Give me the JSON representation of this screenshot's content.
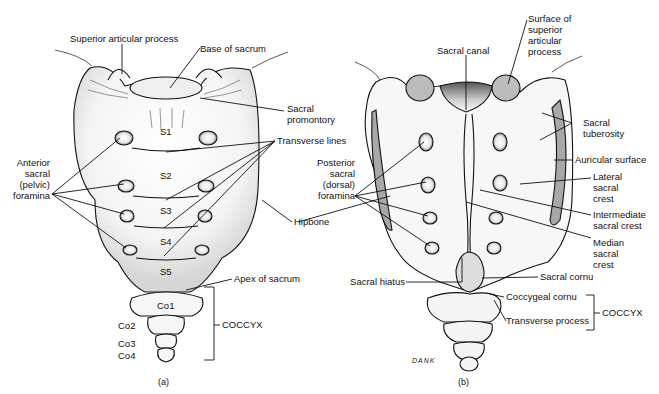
{
  "figure_a": {
    "caption": "(a)",
    "view": "anterior",
    "labels": {
      "superior_articular_process": "Superior articular process",
      "base_of_sacrum": "Base of sacrum",
      "sacral_promontory_1": "Sacral",
      "sacral_promontory_2": "promontory",
      "transverse_lines": "Transverse lines",
      "anterior_foramina_1": "Anterior",
      "anterior_foramina_2": "sacral",
      "anterior_foramina_3": "(pelvic)",
      "anterior_foramina_4": "foramina",
      "hipbone": "Hipbone",
      "apex_of_sacrum": "Apex of sacrum",
      "coccyx": "COCCYX"
    },
    "segments": [
      "S1",
      "S2",
      "S3",
      "S4",
      "S5"
    ],
    "coccygeal": [
      "Co1",
      "Co2",
      "Co3",
      "Co4"
    ]
  },
  "figure_b": {
    "caption": "(b)",
    "view": "posterior",
    "signature": "DANK",
    "labels": {
      "sacral_canal": "Sacral canal",
      "surface_sup_art_1": "Surface of",
      "surface_sup_art_2": "superior",
      "surface_sup_art_3": "articular",
      "surface_sup_art_4": "process",
      "sacral_tuberosity_1": "Sacral",
      "sacral_tuberosity_2": "tuberosity",
      "auricular_surface": "Auricular surface",
      "lateral_crest_1": "Lateral",
      "lateral_crest_2": "sacral",
      "lateral_crest_3": "crest",
      "intermediate_crest_1": "Intermediate",
      "intermediate_crest_2": "sacral crest",
      "median_crest_1": "Median",
      "median_crest_2": "sacral",
      "median_crest_3": "crest",
      "posterior_foramina_1": "Posterior",
      "posterior_foramina_2": "sacral",
      "posterior_foramina_3": "(dorsal)",
      "posterior_foramina_4": "foramina",
      "sacral_hiatus": "Sacral hiatus",
      "sacral_cornu": "Sacral cornu",
      "coccygeal_cornu": "Coccygeal cornu",
      "transverse_process": "Transverse process",
      "coccyx": "COCCYX"
    }
  },
  "colors": {
    "background": "#ffffff",
    "ink": "#111111",
    "shade": "#c8c8c8",
    "articular_fill": "#b8b8b8"
  }
}
